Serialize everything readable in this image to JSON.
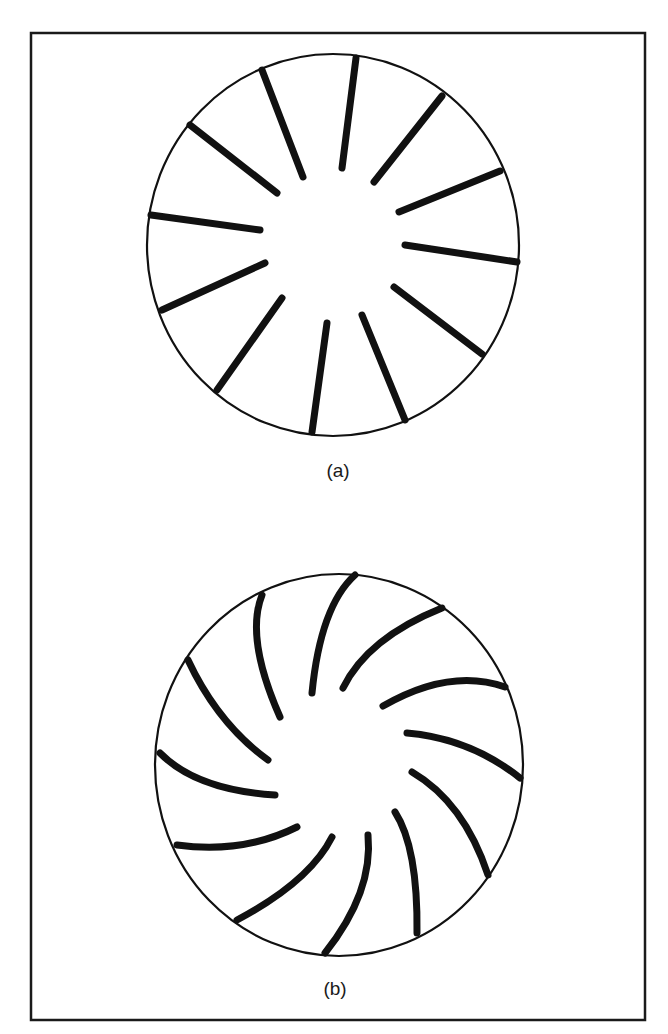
{
  "figure": {
    "frame": {
      "x": 31,
      "y": 33,
      "width": 614,
      "height": 987,
      "stroke": "#1a1a1a",
      "stroke_width": 2.5
    },
    "ink_color": "#111111",
    "panels": [
      {
        "id": "a",
        "label": "(a)",
        "label_pos": {
          "x": 338,
          "y": 460
        },
        "description": "Disk with 12 straight radial slits",
        "circle": {
          "cx": 333,
          "cy": 245,
          "rx": 186,
          "ry": 191,
          "stroke_width": 2.2
        },
        "slit_width": 7,
        "slits": [
          {
            "x1": 356,
            "y1": 58,
            "x2": 342,
            "y2": 168
          },
          {
            "x1": 442,
            "y1": 96,
            "x2": 374,
            "y2": 182
          },
          {
            "x1": 500,
            "y1": 171,
            "x2": 399,
            "y2": 212
          },
          {
            "x1": 517,
            "y1": 262,
            "x2": 405,
            "y2": 245
          },
          {
            "x1": 482,
            "y1": 354,
            "x2": 394,
            "y2": 287
          },
          {
            "x1": 405,
            "y1": 420,
            "x2": 362,
            "y2": 315
          },
          {
            "x1": 312,
            "y1": 432,
            "x2": 327,
            "y2": 323
          },
          {
            "x1": 217,
            "y1": 390,
            "x2": 282,
            "y2": 298
          },
          {
            "x1": 162,
            "y1": 310,
            "x2": 265,
            "y2": 263
          },
          {
            "x1": 151,
            "y1": 215,
            "x2": 260,
            "y2": 230
          },
          {
            "x1": 190,
            "y1": 125,
            "x2": 277,
            "y2": 193
          },
          {
            "x1": 262,
            "y1": 70,
            "x2": 303,
            "y2": 177
          }
        ]
      },
      {
        "id": "b",
        "label": "(b)",
        "label_pos": {
          "x": 335,
          "y": 978
        },
        "description": "Disk with 12 curved (spiral) blades",
        "circle": {
          "cx": 339,
          "cy": 765,
          "rx": 184,
          "ry": 191,
          "stroke_width": 2.2
        },
        "blade_width": 7,
        "blades": [
          {
            "x1": 355,
            "y1": 575,
            "mx": 327,
            "my": 620,
            "x2": 312,
            "y2": 693
          },
          {
            "x1": 442,
            "y1": 608,
            "mx": 380,
            "my": 643,
            "x2": 343,
            "y2": 688
          },
          {
            "x1": 505,
            "y1": 687,
            "mx": 447,
            "my": 682,
            "x2": 383,
            "y2": 706
          },
          {
            "x1": 520,
            "y1": 778,
            "mx": 467,
            "my": 747,
            "x2": 407,
            "y2": 733
          },
          {
            "x1": 488,
            "y1": 875,
            "mx": 457,
            "my": 813,
            "x2": 412,
            "y2": 772
          },
          {
            "x1": 417,
            "y1": 933,
            "mx": 412,
            "my": 860,
            "x2": 395,
            "y2": 812
          },
          {
            "x1": 325,
            "y1": 953,
            "mx": 360,
            "my": 893,
            "x2": 368,
            "y2": 835
          },
          {
            "x1": 237,
            "y1": 920,
            "mx": 297,
            "my": 880,
            "x2": 332,
            "y2": 837
          },
          {
            "x1": 177,
            "y1": 845,
            "mx": 240,
            "my": 845,
            "x2": 297,
            "y2": 827
          },
          {
            "x1": 160,
            "y1": 753,
            "mx": 207,
            "my": 782,
            "x2": 275,
            "y2": 795
          },
          {
            "x1": 188,
            "y1": 660,
            "mx": 223,
            "my": 717,
            "x2": 268,
            "y2": 760
          },
          {
            "x1": 262,
            "y1": 595,
            "mx": 258,
            "my": 647,
            "x2": 280,
            "y2": 717
          }
        ]
      }
    ]
  }
}
